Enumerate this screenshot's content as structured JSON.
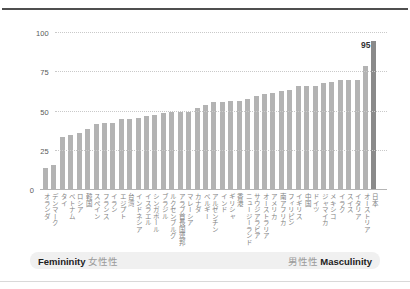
{
  "chart_data": {
    "type": "bar",
    "title": "",
    "xlabel": "",
    "ylabel": "",
    "ylim": [
      0,
      100
    ],
    "yticks": [
      0,
      25,
      50,
      75,
      100
    ],
    "grid": "horizontal-dotted",
    "legend": "none",
    "bar_color": "#b3b3b3",
    "highlight_category": "日本",
    "highlight_color": "#8a8a8a",
    "data_label": {
      "category": "日本",
      "text": "95"
    },
    "categories": [
      "オランダ",
      "デンマーク",
      "タイ",
      "ベトナム",
      "ロシア",
      "韓国",
      "スペイン",
      "フランス",
      "イラン",
      "エジプト",
      "台湾",
      "インドネシア",
      "イスラエル",
      "シンガポール",
      "ブラジル",
      "ルクセンブルグ",
      "アラブ首長国連邦",
      "マレーシア",
      "カナダ",
      "ベルギー",
      "アルゼンチン",
      "インド",
      "ギリシャ",
      "香港",
      "ニュージーランド",
      "サウジアラビア",
      "オーストラリア",
      "アメリカ",
      "南アフリカ",
      "フィリピン",
      "イギリス",
      "中国",
      "ドイツ",
      "ジャマイカ",
      "メキシコ",
      "イラク",
      "スイス",
      "イタリア",
      "オーストリア",
      "日本"
    ],
    "values": [
      14,
      16,
      34,
      35,
      36,
      39,
      42,
      43,
      43,
      45,
      45,
      46,
      47,
      48,
      49,
      50,
      50,
      50,
      52,
      54,
      56,
      56,
      57,
      57,
      58,
      60,
      61,
      62,
      63,
      64,
      66,
      66,
      66,
      68,
      69,
      70,
      70,
      70,
      79,
      95
    ]
  },
  "footer": {
    "left_en": "Femininity",
    "left_ja": "女性性",
    "right_ja": "男性性",
    "right_en": "Masculinity"
  }
}
